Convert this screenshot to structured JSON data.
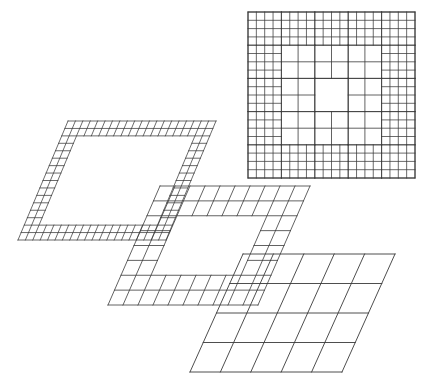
{
  "figure": {
    "background_color": "#ffffff",
    "line_color": "#3a3a3a",
    "canvas": {
      "width": 423,
      "height": 387
    }
  },
  "chart_data": {
    "type": "diagram",
    "grid": "on",
    "legend": "none",
    "panels": [
      {
        "id": "composite-square",
        "name": "composite-plan-view",
        "projection": "plan",
        "origin": [
          248,
          12
        ],
        "size": [
          167,
          166
        ],
        "base_divisions": 5,
        "border_rings": [
          {
            "ring": 1,
            "divisions_per_base_cell": 4
          },
          {
            "ring": 2,
            "divisions_per_base_cell": 2
          }
        ],
        "interior": "unrefined",
        "level_count": 3
      },
      {
        "id": "level-3-fine",
        "name": "fine-grid-patch",
        "projection": "oblique",
        "level": 3,
        "origin": [
          68,
          121
        ],
        "u_vector": [
          148,
          0
        ],
        "v_vector": [
          -50,
          119
        ],
        "divisions_u": 20,
        "divisions_v": 16,
        "border_thickness_cells": 2,
        "interior": "hollow"
      },
      {
        "id": "level-2-medium",
        "name": "medium-grid-patch",
        "projection": "oblique",
        "level": 2,
        "origin": [
          160,
          186
        ],
        "u_vector": [
          150,
          0
        ],
        "v_vector": [
          -52,
          119
        ],
        "divisions_u": 10,
        "divisions_v": 8,
        "border_thickness_cells": 2,
        "interior": "hollow"
      },
      {
        "id": "level-1-coarse",
        "name": "coarse-grid-patch",
        "projection": "oblique",
        "level": 1,
        "origin": [
          243,
          254
        ],
        "u_vector": [
          152,
          0
        ],
        "v_vector": [
          -53,
          118
        ],
        "divisions_u": 5,
        "divisions_v": 4,
        "border_thickness_cells": 0,
        "interior": "full"
      }
    ],
    "composite_rows": [
      [
        "f",
        "f",
        "f",
        "f",
        "f",
        "f",
        "f",
        "f",
        "f",
        "f",
        "f",
        "f",
        "f",
        "f",
        "f",
        "f",
        "f",
        "f",
        "f",
        "f"
      ],
      [
        "f",
        "f",
        "f",
        "f",
        "f",
        "f",
        "f",
        "f",
        "f",
        "f",
        "f",
        "f",
        "f",
        "f",
        "f",
        "f",
        "f",
        "f",
        "f",
        "f"
      ],
      [
        "f",
        "f",
        "m",
        "m",
        "m",
        "m",
        "m",
        "m",
        "m",
        "m",
        "m",
        "m",
        "m",
        "m",
        "m",
        "m",
        "f",
        "f"
      ],
      [
        "f",
        "f",
        "m",
        "m",
        "c",
        "c",
        "c",
        "c",
        "c",
        "c",
        "m",
        "m",
        "f",
        "f"
      ],
      [
        "f",
        "f",
        "m",
        "m",
        "c",
        "c",
        "c",
        "c",
        "c",
        "c",
        "m",
        "m",
        "f",
        "f"
      ],
      [
        "f",
        "f",
        "m",
        "m",
        "m",
        "m",
        "m",
        "m",
        "m",
        "m",
        "m",
        "m",
        "m",
        "m",
        "m",
        "m",
        "f",
        "f"
      ],
      [
        "f",
        "f",
        "f",
        "f",
        "f",
        "f",
        "f",
        "f",
        "f",
        "f",
        "f",
        "f",
        "f",
        "f",
        "f",
        "f",
        "f",
        "f",
        "f",
        "f"
      ],
      [
        "f",
        "f",
        "f",
        "f",
        "f",
        "f",
        "f",
        "f",
        "f",
        "f",
        "f",
        "f",
        "f",
        "f",
        "f",
        "f",
        "f",
        "f",
        "f",
        "f"
      ]
    ]
  }
}
